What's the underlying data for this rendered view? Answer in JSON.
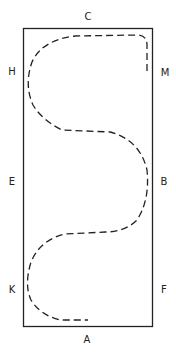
{
  "diagram": {
    "labels": {
      "top": "C",
      "bottom": "A",
      "left_upper": "H",
      "left_middle": "E",
      "left_lower": "K",
      "right_upper": "M",
      "right_middle": "B",
      "right_lower": "F"
    },
    "colors": {
      "stroke": "#222222",
      "background": "#ffffff"
    }
  }
}
